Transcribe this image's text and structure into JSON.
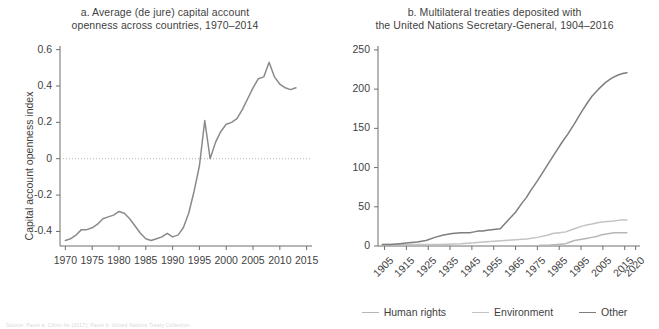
{
  "figure": {
    "source_note": "Source: Panel a: Chinn-Ito (2017); Panel b: United Nations Treaty Collection."
  },
  "panel_a": {
    "title": "a. Average (de jure) capital account openness across countries, 1970–2014",
    "title_line1": "a. Average (de jure) capital account",
    "title_line2": "openness across countries, 1970–2014",
    "ylabel": "Capital account openness index",
    "line_color": "#8a8a8a",
    "axis_color": "#6e6e6e",
    "zero_line_color": "#b4b4b4"
  },
  "panel_b": {
    "title": "b. Multilateral treaties deposited with the United Nations Secretary-General, 1904–2016",
    "title_line1": "b. Multilateral treaties deposited with",
    "title_line2": "the United Nations Secretary-General, 1904–2016",
    "ylabel": "Number of treaties",
    "axis_color": "#6e6e6e",
    "legend": [
      {
        "label": "Human rights",
        "color": "#b6b6b6"
      },
      {
        "label": "Environment",
        "color": "#c3c3c3"
      },
      {
        "label": "Other",
        "color": "#7e7e7e"
      }
    ]
  },
  "chart_data": [
    {
      "type": "line",
      "id": "panel_a",
      "title": "a. Average (de jure) capital account openness across countries, 1970–2014",
      "xlabel": "",
      "ylabel": "Capital account openness index",
      "xlim": [
        1969,
        2016
      ],
      "ylim": [
        -0.48,
        0.62
      ],
      "xticks": [
        1970,
        1975,
        1980,
        1985,
        1990,
        1995,
        2000,
        2005,
        2010,
        2015
      ],
      "yticks": [
        -0.4,
        -0.2,
        0,
        0.2,
        0.4,
        0.6
      ],
      "grid": false,
      "legend_position": "none",
      "annotations": [
        "dotted reference line at y = 0"
      ],
      "series": [
        {
          "name": "Average capital account openness index",
          "color": "#8a8a8a",
          "x": [
            1970,
            1971,
            1972,
            1973,
            1974,
            1975,
            1976,
            1977,
            1978,
            1979,
            1980,
            1981,
            1982,
            1983,
            1984,
            1985,
            1986,
            1987,
            1988,
            1989,
            1990,
            1991,
            1992,
            1993,
            1994,
            1995,
            1996,
            1997,
            1998,
            1999,
            2000,
            2001,
            2002,
            2003,
            2004,
            2005,
            2006,
            2007,
            2008,
            2009,
            2010,
            2011,
            2012,
            2013
          ],
          "values": [
            -0.45,
            -0.44,
            -0.42,
            -0.39,
            -0.39,
            -0.38,
            -0.36,
            -0.33,
            -0.32,
            -0.31,
            -0.29,
            -0.3,
            -0.33,
            -0.37,
            -0.41,
            -0.44,
            -0.45,
            -0.44,
            -0.43,
            -0.41,
            -0.43,
            -0.42,
            -0.38,
            -0.3,
            -0.18,
            -0.04,
            0.21,
            0.0,
            0.09,
            0.15,
            0.19,
            0.2,
            0.22,
            0.27,
            0.33,
            0.39,
            0.44,
            0.45,
            0.53,
            0.45,
            0.41,
            0.39,
            0.38,
            0.39
          ]
        }
      ]
    },
    {
      "type": "line",
      "id": "panel_b",
      "title": "b. Multilateral treaties deposited with the United Nations Secretary-General, 1904–2016",
      "xlabel": "",
      "ylabel": "Number of treaties",
      "xlim": [
        1902,
        2022
      ],
      "ylim": [
        0,
        255
      ],
      "xticks": [
        1905,
        1915,
        1925,
        1935,
        1945,
        1955,
        1965,
        1975,
        1985,
        1995,
        2005,
        2015,
        2020
      ],
      "yticks": [
        0,
        50,
        100,
        150,
        200,
        250
      ],
      "grid": false,
      "legend_position": "bottom",
      "series": [
        {
          "name": "Human rights",
          "color": "#b6b6b6",
          "x": [
            1976,
            1980,
            1984,
            1988,
            1990,
            1992,
            1994,
            1996,
            1998,
            2000,
            2002,
            2004,
            2006,
            2008,
            2010,
            2012,
            2014,
            2016
          ],
          "values": [
            1,
            1,
            2,
            3,
            5,
            7,
            8,
            9,
            10,
            11,
            12,
            14,
            15,
            16,
            17,
            17,
            17,
            17
          ]
        },
        {
          "name": "Environment",
          "color": "#c3c3c3",
          "x": [
            1904,
            1910,
            1920,
            1930,
            1940,
            1946,
            1950,
            1955,
            1960,
            1965,
            1970,
            1975,
            1980,
            1982,
            1985,
            1988,
            1990,
            1992,
            1995,
            1998,
            2000,
            2003,
            2006,
            2010,
            2013,
            2016
          ],
          "values": [
            2,
            2,
            2,
            2,
            3,
            4,
            5,
            6,
            7,
            8,
            9,
            11,
            14,
            16,
            17,
            18,
            20,
            22,
            25,
            27,
            28,
            30,
            31,
            32,
            33,
            33
          ]
        },
        {
          "name": "Other",
          "color": "#7e7e7e",
          "x": [
            1904,
            1908,
            1912,
            1916,
            1920,
            1924,
            1928,
            1932,
            1936,
            1940,
            1944,
            1946,
            1948,
            1950,
            1952,
            1955,
            1958,
            1960,
            1962,
            1965,
            1968,
            1970,
            1972,
            1975,
            1978,
            1980,
            1983,
            1986,
            1989,
            1992,
            1995,
            1998,
            2000,
            2003,
            2006,
            2009,
            2012,
            2014,
            2016
          ],
          "values": [
            2,
            2,
            3,
            4,
            5,
            7,
            11,
            14,
            16,
            17,
            17,
            18,
            19,
            19,
            20,
            21,
            22,
            28,
            34,
            43,
            55,
            62,
            71,
            83,
            96,
            105,
            118,
            131,
            143,
            156,
            170,
            183,
            191,
            200,
            208,
            214,
            218,
            220,
            221
          ]
        }
      ]
    }
  ]
}
